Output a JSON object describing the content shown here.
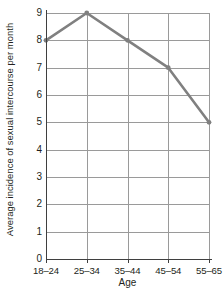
{
  "chart_data": {
    "type": "line",
    "title": "",
    "xlabel": "Age",
    "ylabel": "Average incidence of sexual intercourse per month",
    "categories": [
      "18–24",
      "25–34",
      "35–44",
      "45–54",
      "55–65"
    ],
    "values": [
      8,
      9,
      8,
      7,
      5
    ],
    "series": [
      {
        "name": "Average incidence of sexual intercourse per month",
        "values": [
          8,
          9,
          8,
          7,
          5
        ]
      }
    ],
    "ylim": [
      0,
      9
    ],
    "yticks": [
      0,
      1,
      2,
      3,
      4,
      5,
      6,
      7,
      8,
      9
    ],
    "ytick_labels": [
      "0",
      "1",
      "2",
      "3",
      "4",
      "5",
      "6",
      "7",
      "8",
      "9"
    ],
    "grid": true,
    "grid_horizontal": true,
    "grid_vertical": true,
    "legend": false,
    "legend_position": "none",
    "markers": true,
    "line_color": "#808080",
    "grid_color": "#9a9a9a",
    "axis_color": "#3f3f3f",
    "text_color": "#231f20",
    "background_color": "#ffffff"
  }
}
